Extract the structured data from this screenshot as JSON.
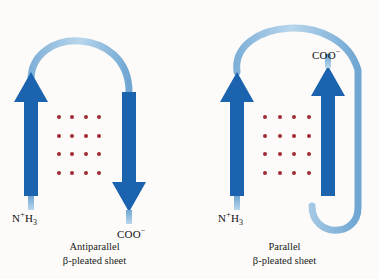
{
  "figure": {
    "background_color": "#fcfbf9",
    "strand_color": "#1b63ae",
    "ribbon_color": "#92bcdf",
    "hbond_dot_color": "#9e2b36"
  },
  "panels": [
    {
      "id": "antiparallel",
      "caption_line1": "Antiparallel",
      "caption_line2": "β-pleated sheet",
      "n_terminus": {
        "text": "N",
        "charge": "+",
        "subscript": "H",
        "sub_count": "3",
        "full": "N+H3"
      },
      "c_terminus": {
        "text": "COO",
        "charge": "−",
        "full": "COO−"
      },
      "strands": [
        {
          "name": "strand-left",
          "direction": "up"
        },
        {
          "name": "strand-right",
          "direction": "down"
        }
      ],
      "hbond_rows": 4,
      "hbond_cols": 4
    },
    {
      "id": "parallel",
      "caption_line1": "Parallel",
      "caption_line2": "β-pleated sheet",
      "n_terminus": {
        "text": "N",
        "charge": "+",
        "subscript": "H",
        "sub_count": "3",
        "full": "N+H3"
      },
      "c_terminus": {
        "text": "COO",
        "charge": "−",
        "full": "COO−"
      },
      "strands": [
        {
          "name": "strand-left",
          "direction": "up"
        },
        {
          "name": "strand-right",
          "direction": "up"
        }
      ],
      "hbond_rows": 4,
      "hbond_cols": 4
    }
  ]
}
